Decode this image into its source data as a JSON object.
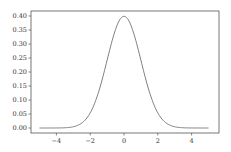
{
  "chart_data": {
    "type": "line",
    "title": "",
    "xlabel": "",
    "ylabel": "",
    "xlim": [
      -5.5,
      5.5
    ],
    "ylim": [
      -0.02,
      0.42
    ],
    "grid": false,
    "legend": null,
    "x_ticks": [
      -4,
      -2,
      0,
      2,
      4
    ],
    "x_tick_labels": [
      "−4",
      "−2",
      "0",
      "2",
      "4"
    ],
    "y_ticks": [
      0.0,
      0.05,
      0.1,
      0.15,
      0.2,
      0.25,
      0.3,
      0.35,
      0.4
    ],
    "y_tick_labels": [
      "0.00",
      "0.05",
      "0.10",
      "0.15",
      "0.20",
      "0.25",
      "0.30",
      "0.35",
      "0.40"
    ],
    "series": [
      {
        "name": "standard normal pdf",
        "color": "#7f7f7f",
        "x": [
          -5,
          -4,
          -3.5,
          -3,
          -2.5,
          -2,
          -1.5,
          -1,
          -0.5,
          0,
          0.5,
          1,
          1.5,
          2,
          2.5,
          3,
          3.5,
          4,
          5
        ],
        "y": [
          0.0,
          0.0001,
          0.0009,
          0.0044,
          0.0175,
          0.054,
          0.1295,
          0.242,
          0.3521,
          0.3989,
          0.3521,
          0.242,
          0.1295,
          0.054,
          0.0175,
          0.0044,
          0.0009,
          0.0001,
          0.0
        ]
      }
    ]
  },
  "colors": {
    "axes": "#333333",
    "line": "#7f7f7f",
    "background": "#ffffff"
  }
}
